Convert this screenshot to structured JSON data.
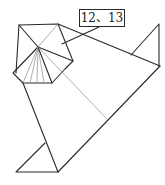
{
  "diagram": {
    "label": "12、13",
    "colors": {
      "line": "#2a2a2a",
      "fold": "#9a9a9a",
      "background": "#ffffff"
    }
  }
}
